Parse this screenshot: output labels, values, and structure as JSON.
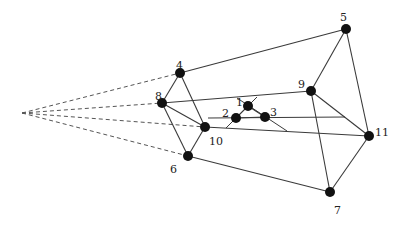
{
  "diagram": {
    "type": "graph",
    "nodes": [
      {
        "id": "1",
        "label": "1",
        "x": 248,
        "y": 106,
        "lx": 236,
        "ly": 102
      },
      {
        "id": "2",
        "label": "2",
        "x": 236,
        "y": 118,
        "lx": 222,
        "ly": 113
      },
      {
        "id": "3",
        "label": "3",
        "x": 265,
        "y": 117,
        "lx": 270,
        "ly": 112
      },
      {
        "id": "4",
        "label": "4",
        "x": 180,
        "y": 73,
        "lx": 176,
        "ly": 65
      },
      {
        "id": "5",
        "label": "5",
        "x": 346,
        "y": 29,
        "lx": 340,
        "ly": 17
      },
      {
        "id": "6",
        "label": "6",
        "x": 188,
        "y": 156,
        "lx": 170,
        "ly": 169
      },
      {
        "id": "7",
        "label": "7",
        "x": 330,
        "y": 192,
        "lx": 334,
        "ly": 210
      },
      {
        "id": "8",
        "label": "8",
        "x": 162,
        "y": 103,
        "lx": 155,
        "ly": 96
      },
      {
        "id": "9",
        "label": "9",
        "x": 311,
        "y": 91,
        "lx": 298,
        "ly": 84
      },
      {
        "id": "10",
        "label": "10",
        "x": 205,
        "y": 127,
        "lx": 209,
        "ly": 141
      },
      {
        "id": "11",
        "label": "11",
        "x": 369,
        "y": 136,
        "lx": 375,
        "ly": 132
      }
    ],
    "edges": [
      {
        "from": "4",
        "to": "5"
      },
      {
        "from": "4",
        "to": "8"
      },
      {
        "from": "4",
        "to": "10"
      },
      {
        "from": "8",
        "to": "10"
      },
      {
        "from": "8",
        "to": "6"
      },
      {
        "from": "6",
        "to": "10"
      },
      {
        "from": "6",
        "to": "7"
      },
      {
        "from": "5",
        "to": "9"
      },
      {
        "from": "5",
        "to": "11"
      },
      {
        "from": "9",
        "to": "11"
      },
      {
        "from": "9",
        "to": "7"
      },
      {
        "from": "7",
        "to": "11"
      },
      {
        "from": "10",
        "to": "11"
      },
      {
        "from": "8",
        "to": "9"
      },
      {
        "from": "1",
        "to": "2"
      },
      {
        "from": "1",
        "to": "3"
      },
      {
        "from": "2",
        "to": "3"
      }
    ],
    "partial_segments": [
      {
        "x1": 208,
        "y1": 118,
        "x2": 345,
        "y2": 117
      },
      {
        "x1": 237,
        "y1": 98,
        "x2": 287,
        "y2": 131
      },
      {
        "x1": 257,
        "y1": 97,
        "x2": 226,
        "y2": 128
      }
    ],
    "vanishing_point": {
      "x": 22,
      "y": 113
    },
    "dashed_lines": [
      {
        "to": "4"
      },
      {
        "to": "8"
      },
      {
        "to": "10"
      },
      {
        "to": "6"
      }
    ],
    "colors": {
      "edge": "#3a3a3a",
      "dashed": "#555555",
      "node": "#111111",
      "background": "#ffffff"
    }
  }
}
